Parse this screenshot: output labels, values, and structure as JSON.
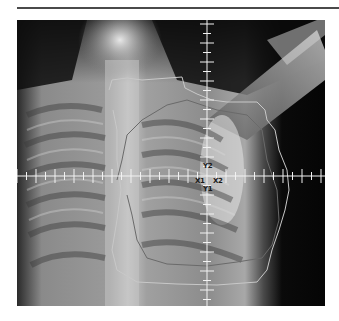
{
  "figure": {
    "crosshair": {
      "x": 190,
      "y": 156
    },
    "field_labels": {
      "top": "Y2",
      "left": "X1",
      "right": "X2",
      "bottom": "Y1"
    },
    "colors": {
      "rule": "#4a4a4a",
      "crosshair": "#f2f2f2",
      "contour_outer": "#c8c8c8",
      "contour_inner": "#6a6a6a",
      "label": "#1a1a1a"
    },
    "contours": {
      "outer": "92,70 95,60 110,58 125,60 165,57 168,68 180,74 195,80 210,82 240,82 248,90 250,100 258,110 262,130 270,150 272,170 268,190 262,210 255,230 250,250 240,262 200,265 160,264 120,262 100,250 95,230 100,200 104,170 100,140 100,110 96,90",
      "inner": "100,160 105,140 110,115 125,100 150,85 170,80 200,90 230,95 245,110 250,140 260,170 262,200 255,225 245,238 220,242 190,246 150,244 130,238 120,220 115,195 110,175"
    }
  }
}
